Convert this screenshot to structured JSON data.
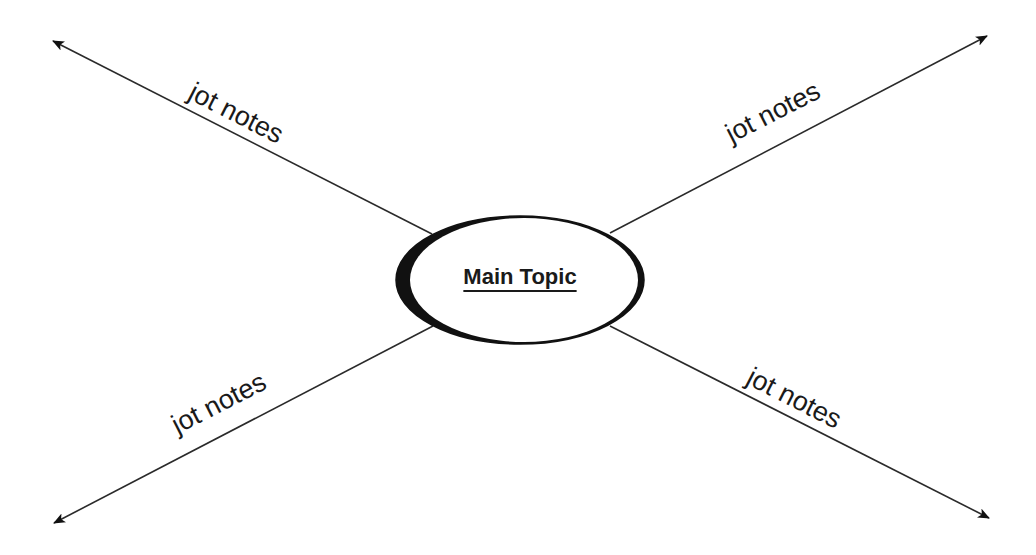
{
  "diagram": {
    "type": "mind-map",
    "center": {
      "label": "Main Topic"
    },
    "branches": [
      {
        "position": "top-left",
        "label": "jot notes"
      },
      {
        "position": "top-right",
        "label": "jot notes"
      },
      {
        "position": "bottom-left",
        "label": "jot notes"
      },
      {
        "position": "bottom-right",
        "label": "jot notes"
      }
    ],
    "colors": {
      "line": "#2a2a2a",
      "background": "#ffffff",
      "text": "#1a1a1a"
    }
  }
}
